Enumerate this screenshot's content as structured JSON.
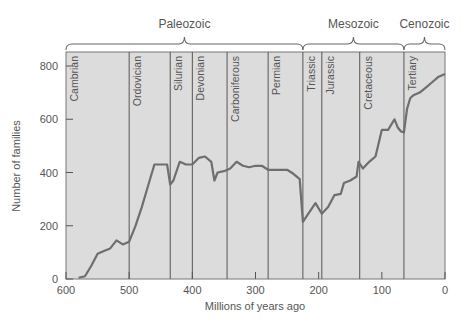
{
  "chart_data": {
    "type": "line",
    "title": "",
    "xlabel": "Millions of years ago",
    "ylabel": "Number of families",
    "xlim": [
      600,
      0
    ],
    "ylim": [
      0,
      800
    ],
    "x_ticks": [
      600,
      500,
      400,
      300,
      200,
      100,
      0
    ],
    "y_ticks": [
      0,
      200,
      400,
      600,
      800
    ],
    "grid": false,
    "eras": [
      {
        "name": "Paleozoic",
        "start": 570,
        "end": 225
      },
      {
        "name": "Mesozoic",
        "start": 225,
        "end": 65
      },
      {
        "name": "Cenozoic",
        "start": 65,
        "end": 0
      }
    ],
    "periods": [
      {
        "name": "Cambrian",
        "start": 600,
        "end": 500
      },
      {
        "name": "Ordovician",
        "start": 500,
        "end": 435
      },
      {
        "name": "Silurian",
        "start": 435,
        "end": 400
      },
      {
        "name": "Devonian",
        "start": 400,
        "end": 345
      },
      {
        "name": "Carboniferous",
        "start": 345,
        "end": 280
      },
      {
        "name": "Permian",
        "start": 280,
        "end": 225
      },
      {
        "name": "Triassic",
        "start": 225,
        "end": 195
      },
      {
        "name": "Jurassic",
        "start": 195,
        "end": 135
      },
      {
        "name": "Cretaceous",
        "start": 135,
        "end": 65
      },
      {
        "name": "Tertiary",
        "start": 65,
        "end": 0
      }
    ],
    "series": [
      {
        "name": "Number of families",
        "x": [
          580,
          570,
          560,
          550,
          540,
          530,
          520,
          510,
          500,
          490,
          480,
          470,
          460,
          450,
          440,
          435,
          430,
          420,
          410,
          400,
          390,
          380,
          370,
          365,
          360,
          350,
          340,
          330,
          320,
          310,
          300,
          290,
          280,
          270,
          260,
          250,
          240,
          230,
          225,
          215,
          205,
          195,
          185,
          175,
          165,
          160,
          150,
          140,
          137,
          130,
          120,
          110,
          100,
          90,
          80,
          75,
          70,
          65,
          60,
          55,
          50,
          40,
          30,
          20,
          10,
          0
        ],
        "values": [
          5,
          10,
          50,
          95,
          105,
          115,
          145,
          130,
          140,
          200,
          270,
          350,
          430,
          430,
          430,
          355,
          370,
          440,
          430,
          430,
          455,
          460,
          440,
          370,
          400,
          405,
          415,
          440,
          425,
          420,
          425,
          425,
          410,
          410,
          410,
          410,
          395,
          375,
          215,
          250,
          285,
          245,
          270,
          315,
          320,
          360,
          370,
          385,
          440,
          415,
          440,
          460,
          560,
          560,
          600,
          570,
          555,
          550,
          640,
          680,
          690,
          700,
          720,
          740,
          760,
          770
        ]
      }
    ]
  },
  "labels": {
    "xlabel": "Millions of years ago",
    "ylabel": "Number of families",
    "eras": [
      "Paleozoic",
      "Mesozoic",
      "Cenozoic"
    ],
    "periods": [
      "Cambrian",
      "Ordovician",
      "Silurian",
      "Devonian",
      "Carboniferous",
      "Permian",
      "Triassic",
      "Jurassic",
      "Cretaceous",
      "Tertiary"
    ],
    "x_ticks": [
      "600",
      "500",
      "400",
      "300",
      "200",
      "100",
      "0"
    ],
    "y_ticks": [
      "0",
      "200",
      "400",
      "600",
      "800"
    ]
  },
  "colors": {
    "plot_bg": "#dcdcdc",
    "line": "#6e6e6e",
    "boundary": "#555555",
    "text": "#555555"
  }
}
